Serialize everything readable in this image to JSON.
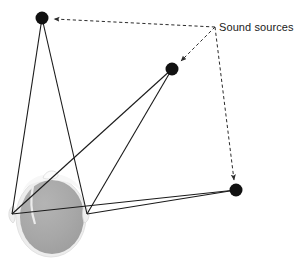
{
  "figure": {
    "title": "",
    "type": "binaural-sound-localization-diagram",
    "background_color": "#ffffff",
    "width": 295,
    "height": 266
  },
  "annotations": {
    "sound_sources_label": "Sound sources",
    "label_position": {
      "x": 219,
      "y": 27
    }
  },
  "colors": {
    "source_dot": "#111111",
    "ray_line": "#1a1a1a",
    "dashed_line": "#2b2b2b",
    "head_fill": "#a8a8a8",
    "head_outline": "#f2f2f2",
    "head_shadow": "#c9c9c9",
    "text": "#1a1a1a"
  },
  "listener": {
    "name": "head",
    "center": {
      "x": 51,
      "y": 216
    },
    "radius_x": 33,
    "radius_y": 38,
    "left_ear": {
      "x": 12,
      "y": 214
    },
    "right_ear": {
      "x": 87,
      "y": 214
    }
  },
  "sound_sources": [
    {
      "id": "source-upper-left",
      "label": "",
      "x": 42,
      "y": 18,
      "radius": 6.5
    },
    {
      "id": "source-middle",
      "label": "",
      "x": 172,
      "y": 69,
      "radius": 6.5
    },
    {
      "id": "source-lower-right",
      "label": "",
      "x": 236,
      "y": 190,
      "radius": 6.5
    }
  ],
  "sound_rays": [
    {
      "from": "source-upper-left",
      "to": "left_ear",
      "x1": 42,
      "y1": 18,
      "x2": 12,
      "y2": 214
    },
    {
      "from": "source-upper-left",
      "to": "right_ear",
      "x1": 42,
      "y1": 18,
      "x2": 87,
      "y2": 214
    },
    {
      "from": "source-middle",
      "to": "left_ear",
      "x1": 172,
      "y1": 69,
      "x2": 12,
      "y2": 214
    },
    {
      "from": "source-middle",
      "to": "right_ear",
      "x1": 172,
      "y1": 69,
      "x2": 87,
      "y2": 214
    },
    {
      "from": "source-lower-right",
      "to": "left_ear",
      "x1": 236,
      "y1": 190,
      "x2": 12,
      "y2": 214
    },
    {
      "from": "source-lower-right",
      "to": "right_ear",
      "x1": 236,
      "y1": 190,
      "x2": 87,
      "y2": 214
    }
  ],
  "leader_lines": [
    {
      "id": "leader-to-upper-left",
      "from": {
        "x": 215,
        "y": 27
      },
      "to": {
        "x": 52,
        "y": 19
      },
      "style": "dashed",
      "arrow": true
    },
    {
      "id": "leader-to-middle",
      "from": {
        "x": 215,
        "y": 27
      },
      "to": {
        "x": 180,
        "y": 62
      },
      "style": "dashed",
      "arrow": true
    },
    {
      "id": "leader-to-lower-right",
      "from": {
        "x": 215,
        "y": 27
      },
      "to": {
        "x": 235,
        "y": 181
      },
      "style": "dashed",
      "arrow": true
    }
  ]
}
